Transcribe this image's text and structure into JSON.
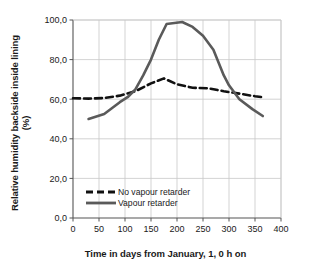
{
  "chart_data": {
    "type": "line",
    "title": "",
    "xlabel": "Time in days from January, 1, 0 h on",
    "ylabel": "Relative humidity backside inside lining (%)",
    "ylabel_line1": "Relative humidity backside inside lining",
    "ylabel_line2": "(%)",
    "xlim": [
      0,
      400
    ],
    "ylim": [
      0,
      100
    ],
    "xticks": [
      0,
      50,
      100,
      150,
      200,
      250,
      300,
      350,
      400
    ],
    "xtick_labels": [
      "0",
      "50",
      "100",
      "150",
      "200",
      "250",
      "300",
      "350",
      "400"
    ],
    "yticks": [
      0,
      20,
      40,
      60,
      80,
      100
    ],
    "ytick_labels": [
      "0,0",
      "20,0",
      "40,0",
      "60,0",
      "80,0",
      "100,0"
    ],
    "grid": true,
    "grid_color": "#c8c8c8",
    "axis_color": "#555555",
    "legend_position": "inside-lower-left",
    "series": [
      {
        "name": "No vapour retarder",
        "style": "dashed",
        "color": "#111111",
        "width": 2.6,
        "x": [
          0,
          30,
          60,
          90,
          120,
          150,
          175,
          200,
          230,
          260,
          290,
          320,
          350,
          365
        ],
        "values": [
          60.5,
          60.3,
          60.6,
          61.8,
          64.0,
          68.0,
          70.5,
          67.5,
          65.8,
          65.5,
          64.0,
          62.8,
          61.5,
          61.0
        ]
      },
      {
        "name": "Vapour retarder",
        "style": "solid",
        "color": "#5a5a5a",
        "width": 2.6,
        "x": [
          30,
          60,
          90,
          105,
          120,
          135,
          150,
          165,
          180,
          195,
          210,
          230,
          250,
          270,
          290,
          300,
          320,
          345,
          365
        ],
        "values": [
          50.0,
          52.5,
          58.5,
          61.0,
          65.0,
          72.0,
          80.0,
          90.0,
          98.0,
          98.5,
          99.0,
          96.5,
          92.0,
          85.0,
          72.0,
          67.0,
          60.0,
          55.0,
          51.5
        ]
      }
    ]
  },
  "legend": {
    "items": [
      {
        "label": "No vapour retarder",
        "style": "dashed",
        "color": "#111111"
      },
      {
        "label": "Vapour retarder",
        "style": "solid",
        "color": "#5a5a5a"
      }
    ]
  }
}
